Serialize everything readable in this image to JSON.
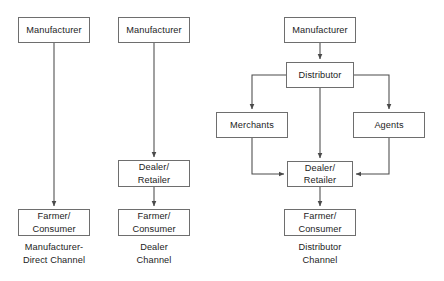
{
  "diagram": {
    "stroke_color": "#6e6e6e",
    "line_color": "#4a4a4a",
    "text_color": "#1c1c1c",
    "background": "#ffffff",
    "channels": [
      {
        "id": "manufacturer-direct",
        "caption": "Manufacturer-\nDirect Channel",
        "nodes": [
          {
            "id": "mfg-1",
            "label": "Manufacturer"
          },
          {
            "id": "farmer-1",
            "label": "Farmer/\nConsumer"
          }
        ],
        "edges": [
          {
            "from": "mfg-1",
            "to": "farmer-1"
          }
        ]
      },
      {
        "id": "dealer",
        "caption": "Dealer\nChannel",
        "nodes": [
          {
            "id": "mfg-2",
            "label": "Manufacturer"
          },
          {
            "id": "dealer-2",
            "label": "Dealer/\nRetailer"
          },
          {
            "id": "farmer-2",
            "label": "Farmer/\nConsumer"
          }
        ],
        "edges": [
          {
            "from": "mfg-2",
            "to": "dealer-2"
          },
          {
            "from": "dealer-2",
            "to": "farmer-2"
          }
        ]
      },
      {
        "id": "distributor",
        "caption": "Distributor\nChannel",
        "nodes": [
          {
            "id": "mfg-3",
            "label": "Manufacturer"
          },
          {
            "id": "distributor-3",
            "label": "Distributor"
          },
          {
            "id": "merchants-3",
            "label": "Merchants"
          },
          {
            "id": "agents-3",
            "label": "Agents"
          },
          {
            "id": "dealer-3",
            "label": "Dealer/\nRetailer"
          },
          {
            "id": "farmer-3",
            "label": "Farmer/\nConsumer"
          }
        ],
        "edges": [
          {
            "from": "mfg-3",
            "to": "distributor-3"
          },
          {
            "from": "distributor-3",
            "to": "merchants-3"
          },
          {
            "from": "distributor-3",
            "to": "agents-3"
          },
          {
            "from": "distributor-3",
            "to": "dealer-3"
          },
          {
            "from": "merchants-3",
            "to": "dealer-3"
          },
          {
            "from": "agents-3",
            "to": "dealer-3"
          },
          {
            "from": "dealer-3",
            "to": "farmer-3"
          }
        ]
      }
    ]
  }
}
